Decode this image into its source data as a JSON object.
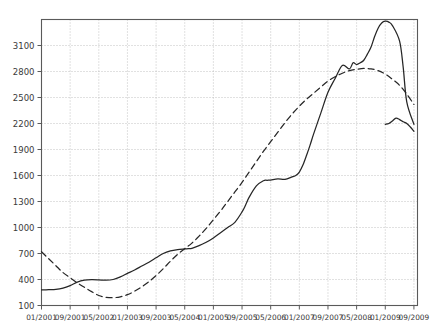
{
  "chart_data": {
    "type": "line",
    "title": "",
    "xlabel": "",
    "ylabel": "",
    "grid": true,
    "legend": "none",
    "xlim": [
      0,
      105
    ],
    "ylim": [
      100,
      3400
    ],
    "y_ticks": [
      100,
      400,
      700,
      1000,
      1300,
      1600,
      1900,
      2200,
      2500,
      2800,
      3100
    ],
    "x_tick_labels": [
      "01/2001",
      "09/2001",
      "05/2002",
      "01/2003",
      "09/2003",
      "05/2004",
      "01/2005",
      "09/2005",
      "05/2006",
      "01/2007",
      "09/2007",
      "05/2008",
      "01/2009",
      "09/2009"
    ],
    "x_tick_positions": [
      0,
      8,
      16,
      24,
      32,
      40,
      48,
      56,
      64,
      72,
      80,
      88,
      96,
      104
    ],
    "series": [
      {
        "name": "solid",
        "style": "solid",
        "color": "#262626",
        "x": [
          0,
          2,
          4,
          6,
          8,
          10,
          12,
          14,
          16,
          18,
          20,
          22,
          24,
          26,
          28,
          30,
          32,
          34,
          36,
          38,
          40,
          41,
          42,
          44,
          46,
          48,
          50,
          52,
          54,
          56,
          57,
          58,
          60,
          62,
          63,
          64,
          66,
          68,
          70,
          71,
          72,
          73,
          74,
          75,
          76,
          78,
          80,
          82,
          84,
          86,
          87,
          88,
          89,
          90,
          91,
          92,
          93,
          94,
          95,
          96,
          97,
          98,
          100,
          101,
          102,
          104
        ],
        "values": [
          280,
          282,
          285,
          300,
          330,
          370,
          392,
          398,
          396,
          392,
          400,
          430,
          470,
          510,
          555,
          600,
          650,
          700,
          730,
          745,
          752,
          755,
          760,
          790,
          830,
          880,
          940,
          1000,
          1060,
          1180,
          1260,
          1350,
          1480,
          1540,
          1545,
          1548,
          1560,
          1555,
          1585,
          1600,
          1640,
          1720,
          1830,
          1950,
          2080,
          2320,
          2560,
          2720,
          2870,
          2830,
          2900,
          2880,
          2900,
          2930,
          3000,
          3080,
          3200,
          3300,
          3360,
          3380,
          3370,
          3330,
          3150,
          2850,
          2450,
          2190
        ]
      },
      {
        "name": "dashed",
        "style": "dashed",
        "color": "#262626",
        "x": [
          0,
          2,
          4,
          6,
          8,
          10,
          12,
          14,
          16,
          18,
          20,
          22,
          24,
          26,
          28,
          30,
          32,
          34,
          36,
          38,
          40,
          42,
          44,
          46,
          48,
          50,
          52,
          54,
          56,
          58,
          60,
          62,
          64,
          66,
          68,
          70,
          72,
          74,
          76,
          78,
          80,
          82,
          84,
          86,
          88,
          90,
          92,
          94,
          96,
          98,
          100,
          102,
          104
        ],
        "values": [
          720,
          640,
          560,
          480,
          420,
          360,
          310,
          260,
          215,
          195,
          190,
          200,
          225,
          265,
          315,
          375,
          445,
          525,
          610,
          690,
          755,
          820,
          900,
          990,
          1090,
          1190,
          1300,
          1410,
          1520,
          1640,
          1760,
          1880,
          1990,
          2100,
          2210,
          2310,
          2400,
          2480,
          2550,
          2620,
          2690,
          2740,
          2780,
          2810,
          2825,
          2835,
          2830,
          2810,
          2770,
          2710,
          2640,
          2540,
          2420
        ]
      }
    ],
    "extra_solid_tail": {
      "x": [
        96,
        97,
        98,
        99,
        100,
        101,
        102,
        103,
        104
      ],
      "values": [
        2190,
        2200,
        2230,
        2262,
        2245,
        2220,
        2200,
        2160,
        2110
      ]
    }
  }
}
